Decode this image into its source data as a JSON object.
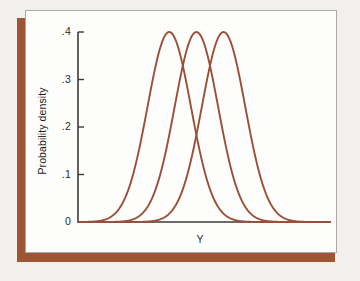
{
  "figure": {
    "background_color": "#f2f0ec",
    "plate_color": "#fdfdfb",
    "plate_border_color": "#a9a9a9",
    "accent_bar_color": "#9d5633",
    "curve_color": "#9a5038",
    "axis_color": "#3a3a3a"
  },
  "chart_data": {
    "type": "line",
    "title": "",
    "subtitle": "",
    "xlabel": "Y",
    "ylabel": "Probability density",
    "grid": false,
    "legend": null,
    "legend_position": "none",
    "annotations": [],
    "xlim": [
      -3.2,
      8.4
    ],
    "ylim": [
      0,
      0.4
    ],
    "xticks": [],
    "xtick_labels": [],
    "yticks": [
      0,
      0.1,
      0.2,
      0.3,
      0.4
    ],
    "ytick_labels": [
      "0",
      ".1",
      ".2",
      ".3",
      ".4"
    ],
    "series": [
      {
        "name": "distribution-1",
        "kind": "normal-density",
        "mean": 1.0,
        "sd": 1.0,
        "peak_value": 0.4,
        "color": "#9a5038"
      },
      {
        "name": "distribution-2",
        "kind": "normal-density",
        "mean": 2.25,
        "sd": 1.0,
        "peak_value": 0.4,
        "color": "#9a5038"
      },
      {
        "name": "distribution-3",
        "kind": "normal-density",
        "mean": 3.5,
        "sd": 1.0,
        "peak_value": 0.4,
        "color": "#9a5038"
      }
    ]
  }
}
